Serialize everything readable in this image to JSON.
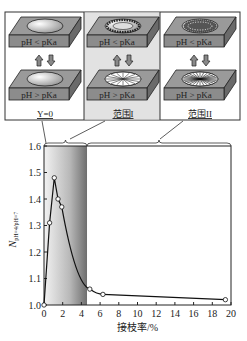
{
  "schematic": {
    "panels": [
      {
        "id": "y0",
        "caption": "Y=0",
        "top_label": "pH < pKa",
        "bottom_label": "pH > pKa",
        "shaded": false,
        "pattern": "plain"
      },
      {
        "id": "range1",
        "caption": "范围I",
        "top_label": "pH < pKa",
        "bottom_label": "pH > pKa",
        "shaded": true,
        "pattern": "ring"
      },
      {
        "id": "range2",
        "caption": "范围II",
        "top_label": "pH < pKa",
        "bottom_label": "pH > pKa",
        "shaded": false,
        "pattern": "dense"
      }
    ]
  },
  "chart_data": {
    "type": "line",
    "title": "",
    "xlabel": "接枝率/%",
    "ylabel": "N_{pH=4/pH=7}",
    "ylabel_main": "N",
    "ylabel_sub": "pH=4/pH=7",
    "xlim": [
      0,
      20
    ],
    "ylim": [
      1.0,
      1.6
    ],
    "x_ticks": [
      0,
      2,
      4,
      6,
      8,
      10,
      12,
      14,
      16,
      18,
      20
    ],
    "y_ticks": [
      1.0,
      1.1,
      1.2,
      1.3,
      1.4,
      1.5,
      1.6
    ],
    "y_tick_labels": [
      "1.0",
      "1.1",
      "1.2",
      "1.3",
      "1.4",
      "1.5",
      "1.6"
    ],
    "grid": false,
    "shaded_region": {
      "x_start": 0,
      "x_end": 4.6,
      "label": "范围I"
    },
    "regions": [
      {
        "label": "Y=0",
        "x": 0
      },
      {
        "label": "范围I",
        "x_range": [
          0,
          4.6
        ]
      },
      {
        "label": "范围II",
        "x_range": [
          4.6,
          20
        ]
      }
    ],
    "series": [
      {
        "name": "N_pH=4/pH=7",
        "x": [
          0,
          0.6,
          1.1,
          1.5,
          1.9,
          4.9,
          6.3,
          19.4
        ],
        "values": [
          1.0,
          1.31,
          1.48,
          1.4,
          1.37,
          1.06,
          1.04,
          1.02
        ],
        "marker": "open-circle"
      }
    ]
  }
}
